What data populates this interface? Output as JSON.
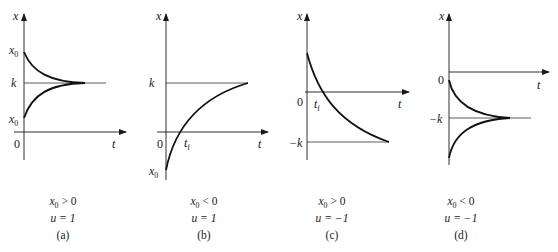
{
  "panels": [
    {
      "id": "a",
      "axis_x_label": "t",
      "axis_y_label": "x",
      "origin_label": "0",
      "tick_labels": {
        "x0_upper": "x",
        "x0_lower": "x",
        "k": "k"
      },
      "subscript": "0",
      "condition_x0": "x",
      "condition_x0_rel": " > 0",
      "condition_u": "u = 1",
      "caption": "(a)"
    },
    {
      "id": "b",
      "axis_x_label": "t",
      "axis_y_label": "x",
      "origin_label": "0",
      "tick_labels": {
        "k": "k",
        "x0": "x",
        "tf": "t"
      },
      "subscript": "0",
      "tf_sub": "f",
      "condition_x0": "x",
      "condition_x0_rel": " < 0",
      "condition_u": "u = 1",
      "caption": "(b)"
    },
    {
      "id": "c",
      "axis_x_label": "t",
      "axis_y_label": "x",
      "origin_label": "0",
      "tick_labels": {
        "neg_k": "−k",
        "tf": "t"
      },
      "tf_sub": "f",
      "subscript": "0",
      "condition_x0": "x",
      "condition_x0_rel": " > 0",
      "condition_u": "u = −1",
      "caption": "(c)"
    },
    {
      "id": "d",
      "axis_x_label": "t",
      "axis_y_label": "x",
      "origin_label": "0",
      "tick_labels": {
        "neg_k": "−k"
      },
      "subscript": "0",
      "condition_x0": "x",
      "condition_x0_rel": " < 0",
      "condition_u": "u = −1",
      "caption": "(d)"
    }
  ],
  "colors": {
    "ink": "#1a1a1a",
    "thin": "#333333"
  }
}
